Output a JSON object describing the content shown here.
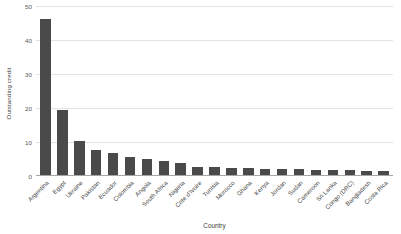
{
  "chart_data": {
    "type": "bar",
    "title": "",
    "xlabel": "Country",
    "ylabel": "Outstanding credit",
    "ylim": [
      0,
      50
    ],
    "yticks": [
      0,
      10,
      20,
      30,
      40,
      50
    ],
    "grid": true,
    "legend": "none",
    "bar_color": "#4a4a4a",
    "gridline_color": "#e3e3e3",
    "categories": [
      "Argentina",
      "Egypt",
      "Ukraine",
      "Pakistan",
      "Ecuador",
      "Colombia",
      "Angola",
      "South Africa",
      "Nigeria",
      "Cote d'Ivoire",
      "Tunisia",
      "Morocco",
      "Ghana",
      "Kenya",
      "Jordan",
      "Sudan",
      "Cameroon",
      "Sri Lanka",
      "Congo (DRC)",
      "Bangladesh",
      "Costa Rica"
    ],
    "values": [
      46.0,
      19.0,
      10.0,
      7.5,
      6.5,
      5.4,
      4.6,
      4.0,
      3.4,
      2.5,
      2.3,
      2.2,
      2.0,
      1.9,
      1.8,
      1.7,
      1.6,
      1.5,
      1.4,
      1.3,
      1.2
    ]
  }
}
